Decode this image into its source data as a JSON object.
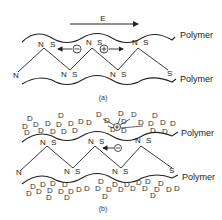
{
  "figure": {
    "panel_a": {
      "caption": "(a)",
      "field_label": "E",
      "polymer_top_label": "Polymer",
      "polymer_bottom_label": "Polymer",
      "negative_charge": "−",
      "positive_charge": "+",
      "top_n": [
        "N",
        "N",
        "N"
      ],
      "top_s": [
        "S",
        "S",
        "S"
      ],
      "bottom_n": [
        "N",
        "N",
        "N"
      ],
      "bottom_s": [
        "S",
        "S",
        "S"
      ]
    },
    "panel_b": {
      "caption": "(b)",
      "polymer_top_label": "Polymer",
      "polymer_bottom_label": "Polymer",
      "negative_charge": "−",
      "positive_charge": "+",
      "dopant_label": "D",
      "top_n": [
        "N",
        "N",
        "N"
      ],
      "top_s": [
        "S",
        "S",
        "S"
      ],
      "bottom_n": [
        "N",
        "N",
        "N"
      ],
      "bottom_s": [
        "S",
        "S",
        "S"
      ]
    }
  },
  "colors": {
    "ink": "#222222",
    "background": "#ffffff"
  }
}
